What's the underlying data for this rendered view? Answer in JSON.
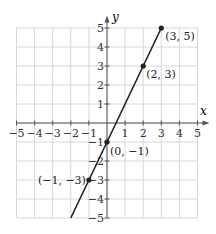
{
  "chart_data": {
    "type": "line",
    "title": "",
    "xlabel": "x",
    "ylabel": "y",
    "xlim": [
      -5,
      5
    ],
    "ylim": [
      -5,
      5
    ],
    "grid": true,
    "x_ticks": [
      "−5",
      "−4",
      "−3",
      "−2",
      "−1",
      "1",
      "2",
      "3",
      "4",
      "5"
    ],
    "y_ticks": [
      "5",
      "4",
      "3",
      "2",
      "1",
      "−1",
      "−2",
      "−3",
      "−4",
      "−5"
    ],
    "line": {
      "equation": "y = 2x − 1",
      "x_range": [
        -2,
        3
      ]
    },
    "points": [
      {
        "x": 3,
        "y": 5,
        "label": "(3, 5)"
      },
      {
        "x": 2,
        "y": 3,
        "label": "(2, 3)"
      },
      {
        "x": 0,
        "y": -1,
        "label": "(0, −1)"
      },
      {
        "x": -1,
        "y": -3,
        "label": "(−1, −3)"
      }
    ]
  },
  "axes": {
    "x_label": "x",
    "y_label": "y"
  },
  "colors": {
    "grid": "#d8d8d8",
    "axis": "#555555",
    "line": "#222222"
  }
}
